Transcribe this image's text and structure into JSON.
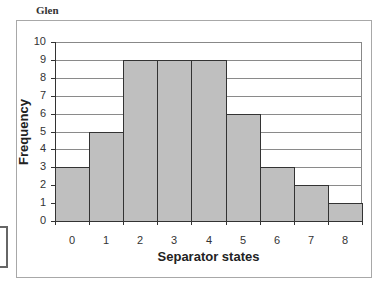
{
  "figure": {
    "title": "Glen"
  },
  "chart_data": {
    "type": "bar",
    "title": "Glen",
    "xlabel": "Separator states",
    "ylabel": "Frequency",
    "categories": [
      "0",
      "1",
      "2",
      "3",
      "4",
      "5",
      "6",
      "7",
      "8"
    ],
    "values": [
      3,
      5,
      9,
      9,
      9,
      6,
      3,
      2,
      1
    ],
    "ylim": [
      0,
      10
    ],
    "yticks": [
      "0",
      "1",
      "2",
      "3",
      "4",
      "5",
      "6",
      "7",
      "8",
      "9",
      "10"
    ],
    "grid": true,
    "legend": null,
    "bar_color": "#bfbfbf",
    "edge_color": "#333333"
  }
}
